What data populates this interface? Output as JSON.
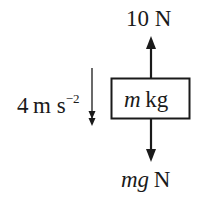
{
  "diagram": {
    "type": "free-body-diagram",
    "body": {
      "mass_var": "m",
      "mass_unit": "kg"
    },
    "forces": [
      {
        "name": "upward-force",
        "direction": "up",
        "label": "10 N",
        "value": "10",
        "unit": "N"
      },
      {
        "name": "weight",
        "direction": "down",
        "var": "mg",
        "unit": "N"
      }
    ],
    "acceleration": {
      "direction": "down",
      "value": "4",
      "unit_base": "m s",
      "unit_exp": "−2"
    },
    "colors": {
      "ink": "#1a1a1a",
      "background": "#ffffff"
    }
  }
}
